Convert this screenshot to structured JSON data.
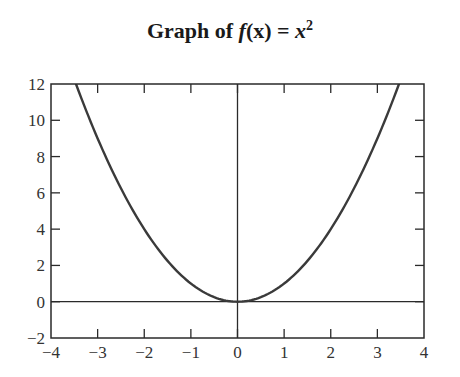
{
  "chart_data": {
    "type": "line",
    "title_parts": {
      "prefix": "Graph of ",
      "func": "f",
      "arg": "(x)",
      "eq": " = ",
      "var": "x",
      "exp": "2"
    },
    "xlabel": "",
    "ylabel": "",
    "xlim": [
      -4,
      4
    ],
    "ylim": [
      -2,
      12
    ],
    "xticks": [
      -4,
      -3,
      -2,
      -1,
      0,
      1,
      2,
      3,
      4
    ],
    "yticks": [
      -2,
      0,
      2,
      4,
      6,
      8,
      10,
      12
    ],
    "xtick_labels": [
      "−4",
      "−3",
      "−2",
      "−1",
      "0",
      "1",
      "2",
      "3",
      "4"
    ],
    "ytick_labels": [
      "−2",
      "0",
      "2",
      "4",
      "6",
      "8",
      "10",
      "12"
    ],
    "grid": false,
    "legend": null,
    "reference_lines": {
      "horizontal_y": 0,
      "vertical_x": 0
    },
    "series": [
      {
        "name": "f(x) = x^2",
        "function": "x^2",
        "x": [
          -3.46,
          -3,
          -2.5,
          -2,
          -1.5,
          -1,
          -0.5,
          0,
          0.5,
          1,
          1.5,
          2,
          2.5,
          3,
          3.46
        ],
        "y": [
          12,
          9,
          6.25,
          4,
          2.25,
          1,
          0.25,
          0,
          0.25,
          1,
          2.25,
          4,
          6.25,
          9,
          12
        ]
      }
    ],
    "colors": {
      "curve": "#3a3a3a",
      "axes": "#2a2a2a",
      "text": "#333333"
    }
  }
}
